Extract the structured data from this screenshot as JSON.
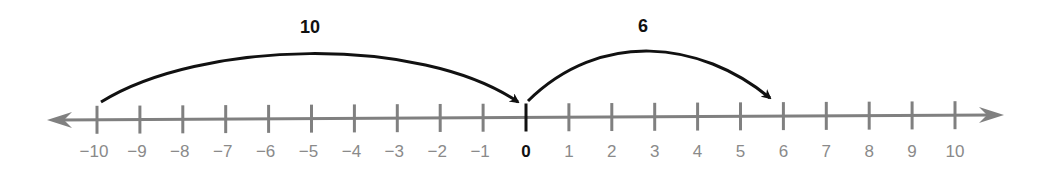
{
  "diagram": {
    "type": "number_line",
    "range": [
      -10,
      10
    ],
    "tick_labels": [
      "−10",
      "−9",
      "−8",
      "−7",
      "−6",
      "−5",
      "−4",
      "−3",
      "−2",
      "−1",
      "0",
      "1",
      "2",
      "3",
      "4",
      "5",
      "6",
      "7",
      "8",
      "9",
      "10"
    ],
    "highlighted_tick": "0",
    "jumps": [
      {
        "label": "10",
        "from": -10,
        "to": 0
      },
      {
        "label": "6",
        "from": 0,
        "to": 6
      }
    ],
    "colors": {
      "axis": "#808080",
      "tick_labels": "#8a8a8a",
      "zero_tick": "#111111",
      "arcs": "#111111"
    }
  }
}
